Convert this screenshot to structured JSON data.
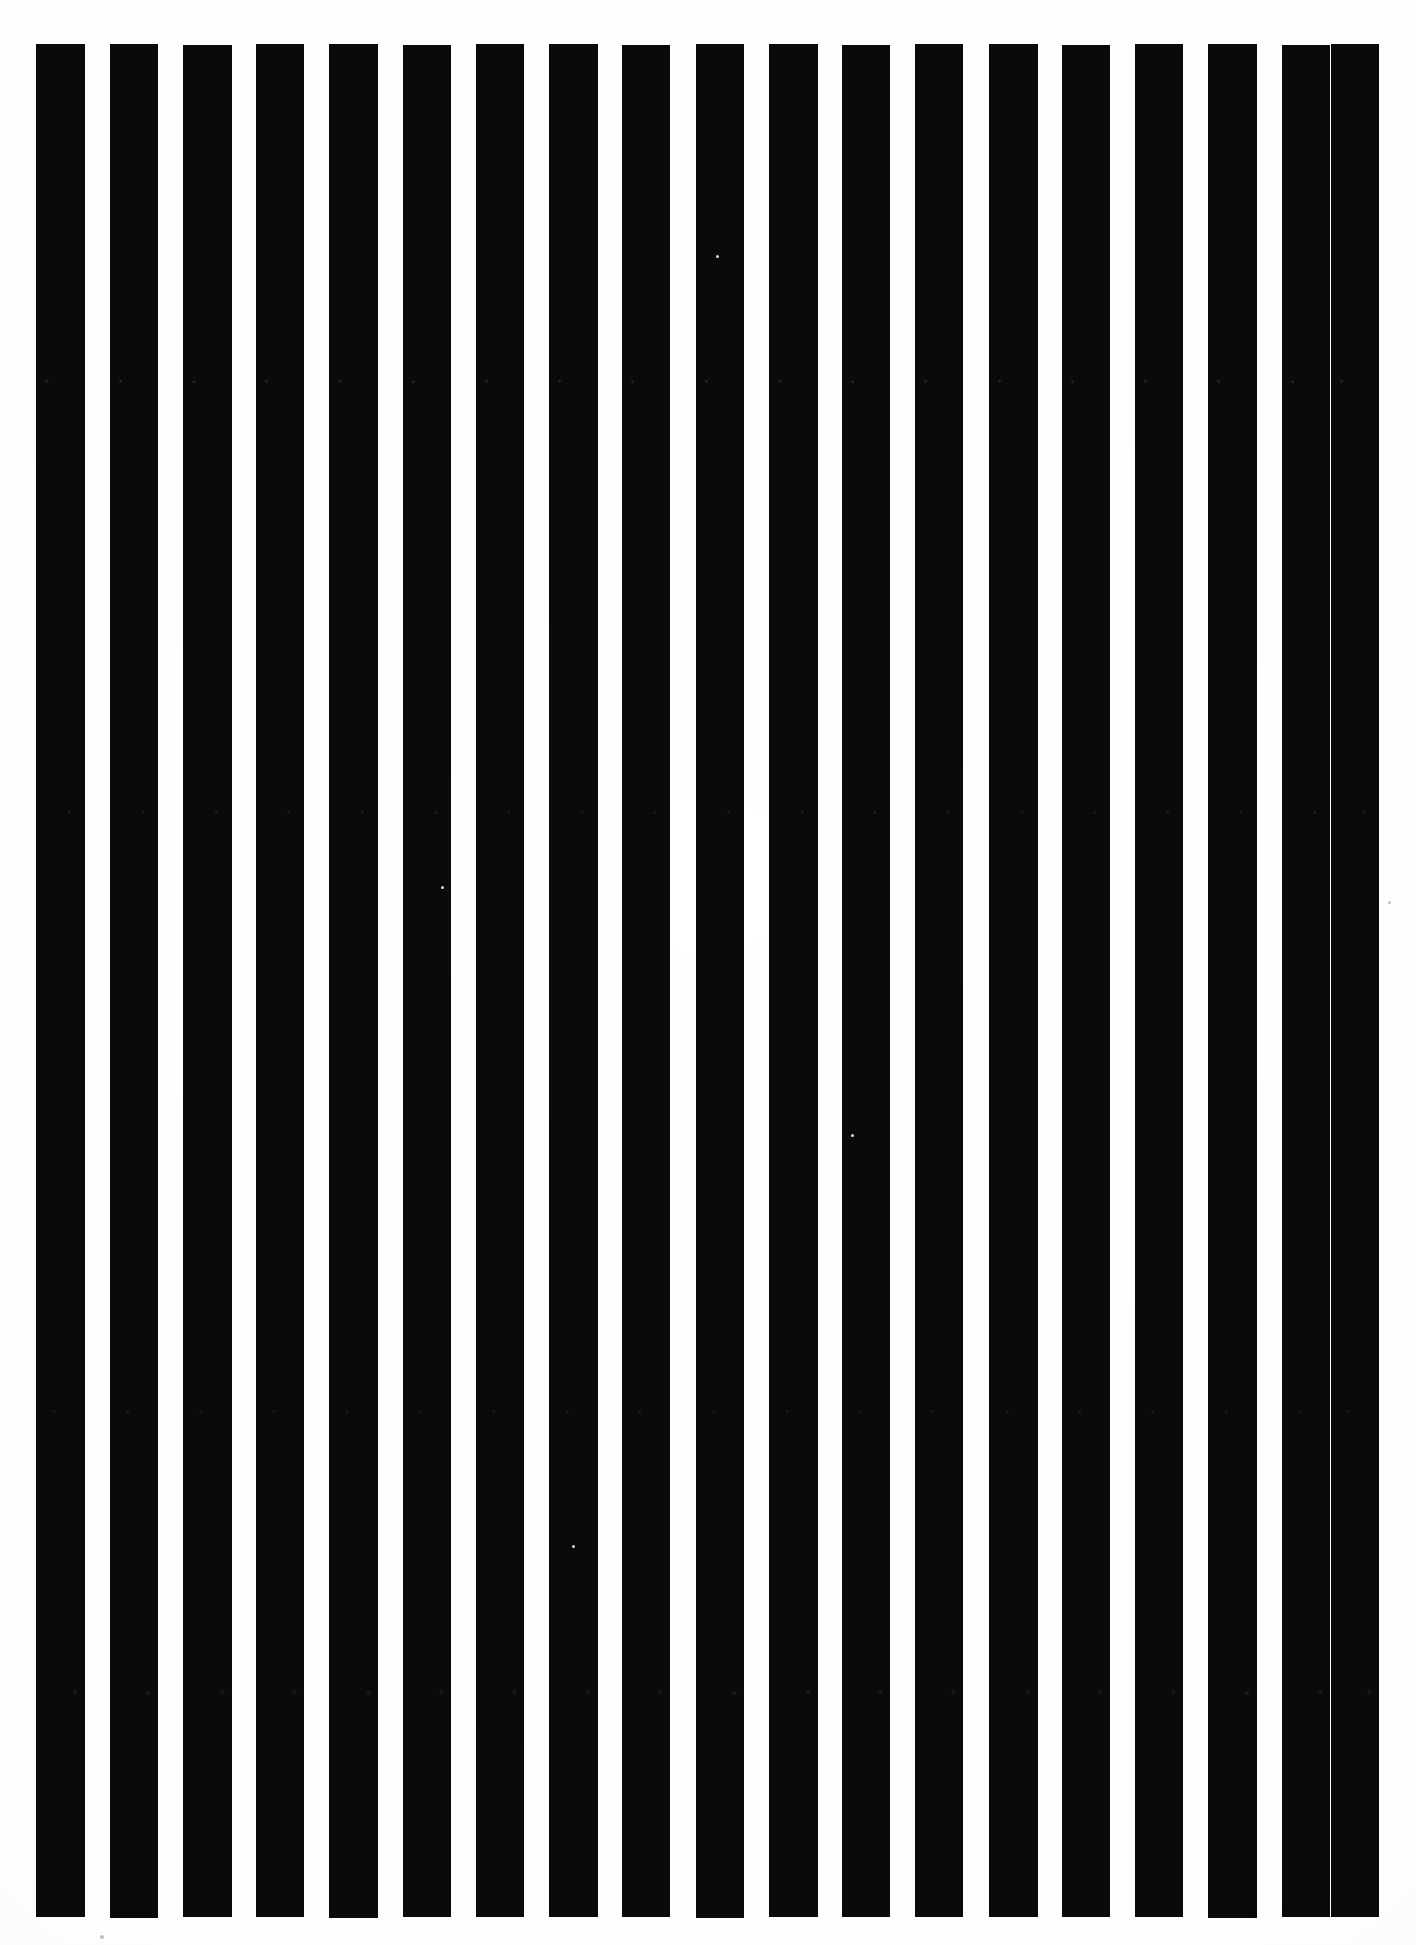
{
  "artwork": {
    "title": "Vertical Stripe Pattern",
    "medium_note": "scanned black-and-white striped artwork",
    "canvas": {
      "width": 1416,
      "height": 1945,
      "background_color": "#fdfdfd"
    },
    "stripes": {
      "count": 19,
      "ink_color": "#0a0a0a",
      "orientation": "vertical",
      "top_y": 44,
      "bottom_y": 1917,
      "first_left_x": 36,
      "last_right_x": 1379,
      "nominal_width": 48,
      "nominal_gap": 25,
      "nominal_pitch": 73.5,
      "bars": [
        {
          "index": 1,
          "x": 36,
          "y": 44,
          "width": 49,
          "height": 1873
        },
        {
          "index": 2,
          "x": 110,
          "y": 44,
          "width": 48,
          "height": 1874
        },
        {
          "index": 3,
          "x": 183,
          "y": 45,
          "width": 49,
          "height": 1872
        },
        {
          "index": 4,
          "x": 256,
          "y": 44,
          "width": 48,
          "height": 1873
        },
        {
          "index": 5,
          "x": 329,
          "y": 44,
          "width": 49,
          "height": 1874
        },
        {
          "index": 6,
          "x": 403,
          "y": 45,
          "width": 48,
          "height": 1872
        },
        {
          "index": 7,
          "x": 476,
          "y": 44,
          "width": 48,
          "height": 1873
        },
        {
          "index": 8,
          "x": 549,
          "y": 44,
          "width": 49,
          "height": 1873
        },
        {
          "index": 9,
          "x": 622,
          "y": 45,
          "width": 48,
          "height": 1872
        },
        {
          "index": 10,
          "x": 696,
          "y": 44,
          "width": 48,
          "height": 1874
        },
        {
          "index": 11,
          "x": 769,
          "y": 44,
          "width": 49,
          "height": 1873
        },
        {
          "index": 12,
          "x": 842,
          "y": 45,
          "width": 48,
          "height": 1872
        },
        {
          "index": 13,
          "x": 915,
          "y": 44,
          "width": 48,
          "height": 1873
        },
        {
          "index": 14,
          "x": 989,
          "y": 44,
          "width": 49,
          "height": 1873
        },
        {
          "index": 15,
          "x": 1062,
          "y": 45,
          "width": 48,
          "height": 1872
        },
        {
          "index": 16,
          "x": 1135,
          "y": 44,
          "width": 48,
          "height": 1873
        },
        {
          "index": 17,
          "x": 1208,
          "y": 44,
          "width": 49,
          "height": 1874
        },
        {
          "index": 18,
          "x": 1282,
          "y": 45,
          "width": 48,
          "height": 1872
        },
        {
          "index": 19,
          "x": 1331,
          "y": 44,
          "width": 48,
          "height": 1873
        }
      ],
      "specks": [
        {
          "x": 386,
          "y": 715,
          "size": 4,
          "tone": "light"
        },
        {
          "x": 966,
          "y": 1197,
          "size": 5,
          "tone": "light"
        },
        {
          "x": 441,
          "y": 886,
          "size": 3,
          "tone": "light"
        },
        {
          "x": 572,
          "y": 1545,
          "size": 3,
          "tone": "light"
        },
        {
          "x": 385,
          "y": 1559,
          "size": 3,
          "tone": "light"
        },
        {
          "x": 978,
          "y": 687,
          "size": 3,
          "tone": "light"
        },
        {
          "x": 851,
          "y": 1134,
          "size": 3,
          "tone": "light"
        },
        {
          "x": 1388,
          "y": 901,
          "size": 3,
          "tone": "dark"
        },
        {
          "x": 100,
          "y": 1935,
          "size": 4,
          "tone": "dark"
        },
        {
          "x": 716,
          "y": 255,
          "size": 3,
          "tone": "light"
        }
      ]
    }
  }
}
